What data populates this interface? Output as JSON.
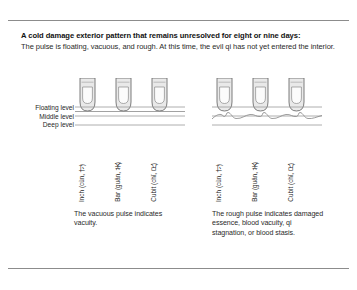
{
  "figure": {
    "title": "A cold damage exterior pattern that remains unresolved for eight or nine days:",
    "lede": "The pulse is floating, vacuous, and rough. At this time, the evil qi has not yet entered the interior.",
    "levels": [
      "Floating level",
      "Middle level",
      "Deep level"
    ],
    "positions": [
      "Inch (cùn, 寸)",
      "Bar (guān, 关)",
      "Cubit (chǐ, 尺)"
    ],
    "panels": [
      {
        "id": "vacuous-pulse",
        "caption": "The vacuous pulse indicates vacuity.",
        "pulse_line": "straight",
        "finger_count": 3
      },
      {
        "id": "rough-pulse",
        "caption": "The rough pulse indicates damaged essence, blood vacuity, qi stagnation, or blood stasis.",
        "pulse_line": "wavy",
        "finger_count": 3
      }
    ],
    "colors": {
      "rule": "#8c8c8c",
      "finger_outline": "#6e6e6e",
      "finger_fill": "#e9e9e9",
      "nail_fill": "#fbfbfb",
      "level_line": "#9a9a9a",
      "pulse_line": "#8a8a8a",
      "text": "#1a1a1a"
    }
  }
}
